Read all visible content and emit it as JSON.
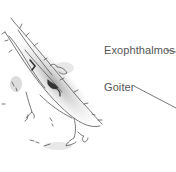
{
  "diagram": {
    "labels": [
      {
        "text": "Exophthalmos"
      },
      {
        "text": "Goiter"
      }
    ],
    "colors": {
      "ink": "#555555",
      "shade": "#bdbdbd",
      "background": "#ffffff"
    }
  }
}
